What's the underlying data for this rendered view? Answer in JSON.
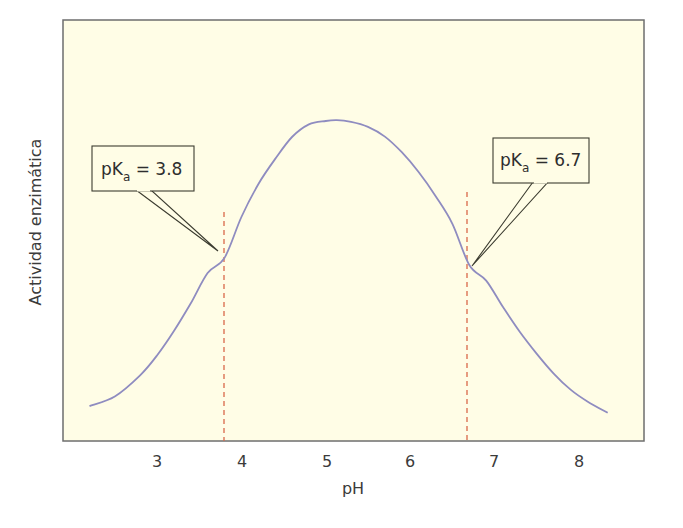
{
  "chart_data": {
    "type": "line",
    "title": "",
    "xlabel": "pH",
    "ylabel": "Actividad enzimática",
    "xlim": [
      1.8,
      8.7
    ],
    "ylim": [
      0,
      100
    ],
    "x_ticks": [
      3,
      4,
      5,
      6,
      7,
      8
    ],
    "x_tick_labels": [
      "3",
      "4",
      "5",
      "6",
      "7",
      "8"
    ],
    "y_ticks": [],
    "grid": false,
    "legend": null,
    "series": [
      {
        "name": "Actividad enzimática",
        "color": "#8f8cc0",
        "x": [
          2.2,
          2.5,
          2.8,
          3.0,
          3.2,
          3.4,
          3.6,
          3.8,
          4.0,
          4.2,
          4.4,
          4.6,
          4.8,
          5.0,
          5.13,
          5.3,
          5.5,
          5.7,
          5.9,
          6.1,
          6.3,
          6.5,
          6.7,
          6.9,
          7.1,
          7.3,
          7.5,
          7.7,
          7.9,
          8.1,
          8.34
        ],
        "y": [
          8.3,
          10.6,
          15.6,
          20.3,
          26.1,
          32.7,
          39.9,
          43.5,
          53.2,
          61.0,
          67.0,
          72.2,
          75.2,
          76.0,
          76.2,
          75.8,
          74.6,
          72.3,
          68.6,
          63.9,
          58.2,
          51.6,
          41.8,
          38.1,
          31.8,
          25.9,
          20.7,
          16.0,
          12.2,
          9.4,
          6.7
        ]
      }
    ],
    "annotations": [
      {
        "type": "vline",
        "x": 3.8,
        "style": "dashed",
        "color": "#d9694a"
      },
      {
        "type": "vline",
        "x": 6.7,
        "style": "dashed",
        "color": "#d9694a"
      },
      {
        "type": "callout",
        "label_main": "pK",
        "label_sub": "a",
        "label_rest": " = 3.8",
        "points_to": [
          3.8,
          43.5
        ]
      },
      {
        "type": "callout",
        "label_main": "pK",
        "label_sub": "a",
        "label_rest": " = 6.7",
        "points_to": [
          6.7,
          41.8
        ]
      }
    ]
  },
  "labels": {
    "xlabel": "pH",
    "ylabel": "Actividad enzimática",
    "ticks": [
      "3",
      "4",
      "5",
      "6",
      "7",
      "8"
    ],
    "callout_left": {
      "main": "pK",
      "sub": "a",
      "rest": " = 3.8"
    },
    "callout_right": {
      "main": "pK",
      "sub": "a",
      "rest": " = 6.7"
    }
  },
  "colors": {
    "plot_background": "#fffde6",
    "frame": "#6e6e6e",
    "curve": "#8f8cc0",
    "dashed": "#d9694a",
    "callout_stroke": "#3c3c30",
    "callout_fill": "#fffde6"
  }
}
